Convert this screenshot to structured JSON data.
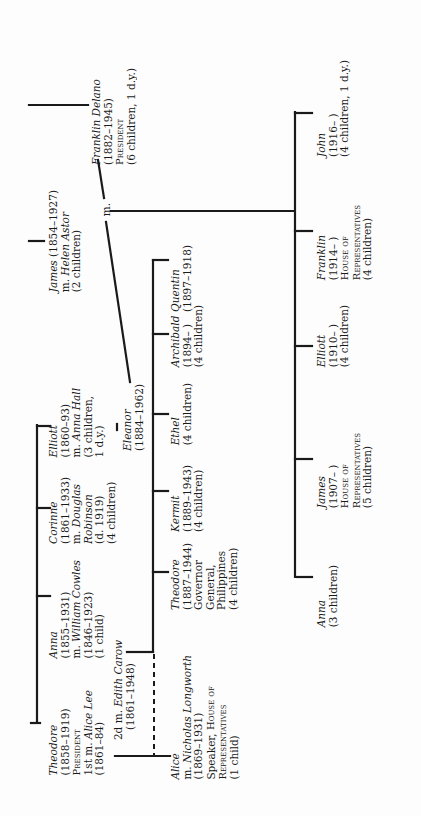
{
  "orientation": "rotated 90 degrees counter-clockwise",
  "marriage_label": "m.",
  "roosevelt_siblings": [
    {
      "name": "Theodore",
      "lines": [
        "(1858–1919)",
        "President",
        "1st m. Alice Lee",
        "(1861–84)",
        "2d m. Edith Carow",
        "(1861–1948)"
      ],
      "title": "President",
      "spouse1": "Alice Lee",
      "spouse1_dates": "(1861–84)",
      "spouse2": "Edith Carow",
      "spouse2_dates": "(1861–1948)",
      "dates": "(1858–1919)"
    },
    {
      "name": "Anna",
      "dates": "(1855–1931)",
      "spouse_prefix": "m.",
      "spouse": "William Cowles",
      "spouse_dates": "(1846–1923)",
      "children": "(1 child)"
    },
    {
      "name": "Corinne",
      "dates": "(1861–1933)",
      "spouse_prefix": "m.",
      "spouse": "Douglas",
      "spouse_line2": "Robinson",
      "spouse_dates": "(d. 1919)",
      "children": "(4 children)"
    },
    {
      "name": "Elliott",
      "dates": "(1860–93)",
      "spouse_prefix": "m.",
      "spouse": "Anna Hall",
      "children": "(3 children,",
      "children2": "1 d.y.)"
    }
  ],
  "james": {
    "name": "James",
    "dates": "(1854–1927)",
    "spouse_prefix": "m.",
    "spouse": "Helen Astor",
    "children": "(2 children)"
  },
  "fdr": {
    "name": "Franklin Delano",
    "dates": "(1882–1945)",
    "title": "President",
    "children": "(6 children, 1 d.y.)"
  },
  "eleanor": {
    "name": "Eleanor",
    "dates": "(1884–1962)"
  },
  "theodore_children": [
    {
      "name": "Alice",
      "spouse_prefix": "m.",
      "spouse": "Nicholas Longworth",
      "spouse_dates": "(1869–1931)",
      "role_a": "Speaker, ",
      "role_b": "House of",
      "role_c": "Representatives",
      "children": "(1 child)"
    },
    {
      "name": "Theodore",
      "dates": "(1887–1944)",
      "role_a": "Governor",
      "role_b": "General,",
      "role_c": "Philippines",
      "children": "(4 children)"
    },
    {
      "name": "Kermit",
      "dates": "(1889–1943)",
      "children": "(4 children)"
    },
    {
      "name": "Ethel",
      "children": "(4 children)"
    },
    {
      "name": "Archibald",
      "dates": "(1894–     )",
      "children": "(4 children)"
    },
    {
      "name": "Quentin",
      "dates": "(1897–1918)"
    }
  ],
  "fdr_children": [
    {
      "name": "Anna",
      "children": "(3 children)"
    },
    {
      "name": "James",
      "dates": "(1907–     )",
      "role_a": "House of",
      "role_b": "Representatives",
      "children": "(5 children)"
    },
    {
      "name": "Elliott",
      "dates": "(1910–     )",
      "children": "(4 children)"
    },
    {
      "name": "Franklin",
      "dates": "(1914–     )",
      "role_a": "House of",
      "role_b": "Representatives",
      "children": "(4 children)"
    },
    {
      "name": "John",
      "dates": "(1916–     )",
      "children": "(4 children, 1 d.y.)"
    }
  ],
  "colors": {
    "ink": "#1a1a1a",
    "paper": "#fdfdfd"
  }
}
